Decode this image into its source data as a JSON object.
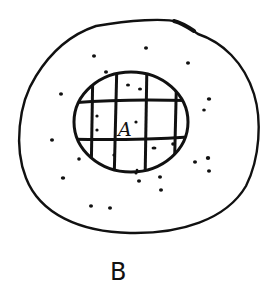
{
  "diagram": {
    "labels": {
      "inner": "A",
      "caption": "B"
    },
    "colors": {
      "ink": "#111111",
      "background": "#ffffff"
    },
    "shapes": {
      "outer_region": {
        "kind": "irregular-oval",
        "bbox": [
          18,
          20,
          262,
          232
        ]
      },
      "inner_region": {
        "kind": "circle",
        "bbox": [
          73,
          72,
          189,
          172
        ],
        "grid": {
          "vertical_lines": 4,
          "horizontal_lines": 2
        }
      }
    },
    "dots_count": 28
  }
}
